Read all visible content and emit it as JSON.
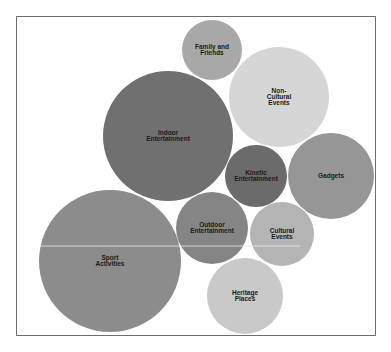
{
  "chart_data": {
    "type": "bubble",
    "title": "",
    "xlabel": "",
    "ylabel": "",
    "grid": false,
    "legend": "none",
    "bubbles": [
      {
        "label": "Family and Friends",
        "lines": [
          "Family and",
          "Friends"
        ],
        "cx": 212,
        "cy": 50,
        "r": 30,
        "color": "#a8a8a8",
        "relative_size": 30
      },
      {
        "label": "Non-Cultural Events",
        "lines": [
          "Non-",
          "Cultural",
          "Events"
        ],
        "cx": 279,
        "cy": 97,
        "r": 50,
        "color": "#d6d6d6",
        "relative_size": 50
      },
      {
        "label": "Indoor Entertainment",
        "lines": [
          "Indoor",
          "Entertainment"
        ],
        "cx": 168,
        "cy": 136,
        "r": 65,
        "color": "#707070",
        "relative_size": 65
      },
      {
        "label": "Kinetic Entertainment",
        "lines": [
          "Kinetic",
          "Entertainment"
        ],
        "cx": 256,
        "cy": 176,
        "r": 31,
        "color": "#6b6b6b",
        "relative_size": 31
      },
      {
        "label": "Gadgets",
        "lines": [
          "Gadgets"
        ],
        "cx": 331,
        "cy": 176,
        "r": 43,
        "color": "#969696",
        "relative_size": 43
      },
      {
        "label": "Outdoor Entertainment",
        "lines": [
          "Outdoor",
          "Entertainment"
        ],
        "cx": 212,
        "cy": 228,
        "r": 36,
        "color": "#858585",
        "relative_size": 36
      },
      {
        "label": "Cultural Events",
        "lines": [
          "Cultural",
          "Events"
        ],
        "cx": 282,
        "cy": 234,
        "r": 32,
        "color": "#b4b4b4",
        "relative_size": 32
      },
      {
        "label": "Sport Activities",
        "lines": [
          "Sport",
          "Activities"
        ],
        "cx": 110,
        "cy": 261,
        "r": 71,
        "color": "#8c8c8c",
        "relative_size": 71
      },
      {
        "label": "Heritage Places",
        "lines": [
          "Heritage",
          "Places"
        ],
        "cx": 245,
        "cy": 296,
        "r": 38,
        "color": "#c9c9c9",
        "relative_size": 38
      }
    ]
  },
  "artifacts": {
    "scanline_y": 246,
    "scanline_color": "#e8e8e8"
  }
}
